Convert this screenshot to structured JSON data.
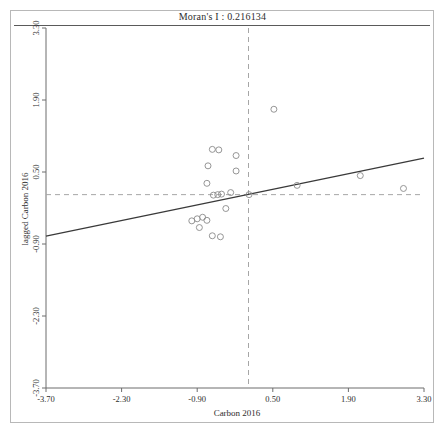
{
  "chart_data": {
    "type": "scatter",
    "title": "Moran's I : 0.216134",
    "morans_i": 0.216134,
    "xlabel": "Carbon 2016",
    "ylabel": "lagged Carbon 2016",
    "xlim": [
      -3.7,
      3.3
    ],
    "ylim": [
      -3.7,
      3.3
    ],
    "xticks": [
      -3.7,
      -2.3,
      -0.9,
      0.5,
      1.9,
      3.3
    ],
    "yticks": [
      -3.7,
      -2.3,
      -0.9,
      0.5,
      1.9,
      3.3
    ],
    "xtick_labels": [
      "-3.70",
      "-2.30",
      "-0.90",
      "0.50",
      "1.90",
      "3.30"
    ],
    "ytick_labels": [
      "-3.70",
      "-2.30",
      "-0.90",
      "0.50",
      "1.90",
      "3.30"
    ],
    "grid": false,
    "legend": null,
    "marker": {
      "shape": "circle",
      "filled": false,
      "size": 3,
      "color": "#8a8a8a"
    },
    "reference_lines": {
      "vertical_mean_x": 0.05,
      "horizontal_mean_y": 0.06,
      "style": "dashed",
      "color": "#9a9a9a"
    },
    "fit_line": {
      "slope": 0.216134,
      "intercept": 0.055,
      "color": "#3a3a3a",
      "x_start": -3.7,
      "x_end": 3.3,
      "y_start": -0.745,
      "y_end": 0.768
    },
    "points": [
      {
        "x": -0.62,
        "y": 0.94
      },
      {
        "x": -0.5,
        "y": 0.93
      },
      {
        "x": -0.7,
        "y": 0.62
      },
      {
        "x": -0.18,
        "y": 0.82
      },
      {
        "x": -0.72,
        "y": 0.28
      },
      {
        "x": -0.18,
        "y": 0.52
      },
      {
        "x": -0.28,
        "y": 0.1
      },
      {
        "x": -0.45,
        "y": 0.07
      },
      {
        "x": -0.52,
        "y": 0.06
      },
      {
        "x": -0.6,
        "y": 0.05
      },
      {
        "x": -0.37,
        "y": -0.21
      },
      {
        "x": -0.9,
        "y": -0.41
      },
      {
        "x": -1.0,
        "y": -0.45
      },
      {
        "x": -0.8,
        "y": -0.38
      },
      {
        "x": -0.72,
        "y": -0.44
      },
      {
        "x": -0.86,
        "y": -0.58
      },
      {
        "x": -0.62,
        "y": -0.74
      },
      {
        "x": -0.47,
        "y": -0.76
      },
      {
        "x": 0.52,
        "y": 1.72
      },
      {
        "x": 0.95,
        "y": 0.24
      },
      {
        "x": 2.12,
        "y": 0.43
      },
      {
        "x": 2.92,
        "y": 0.18
      },
      {
        "x": 0.06,
        "y": 0.06
      }
    ]
  },
  "axes": {
    "x_title": "Carbon 2016",
    "y_title": "lagged Carbon 2016"
  },
  "title": {
    "text": "Moran's I : 0.216134"
  }
}
